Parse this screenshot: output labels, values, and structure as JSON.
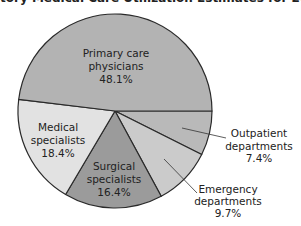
{
  "title": "tory Medical Care Utilization Estimates for 200",
  "chart_data": {
    "type": "pie",
    "start_angle_deg": 0,
    "direction": "clockwise",
    "slices": [
      {
        "name": "Outpatient departments",
        "lines": [
          "Outpatient",
          "departments",
          "7.4%"
        ],
        "value": 7.4,
        "color": "#b9b9b9"
      },
      {
        "name": "Emergency departments",
        "lines": [
          "Emergency",
          "departments",
          "9.7%"
        ],
        "value": 9.7,
        "color": "#cbcbcb"
      },
      {
        "name": "Surgical specialists",
        "lines": [
          "Surgical",
          "specialists",
          "16.4%"
        ],
        "value": 16.4,
        "color": "#9b9b9b"
      },
      {
        "name": "Medical specialists",
        "lines": [
          "Medical",
          "specialists",
          "18.4%"
        ],
        "value": 18.4,
        "color": "#e2e2e2"
      },
      {
        "name": "Primary care physicians",
        "lines": [
          "Primary care",
          "physicians",
          "48.1%"
        ],
        "value": 48.1,
        "color": "#b3b3b3"
      }
    ],
    "legend": "none (direct labels)"
  }
}
